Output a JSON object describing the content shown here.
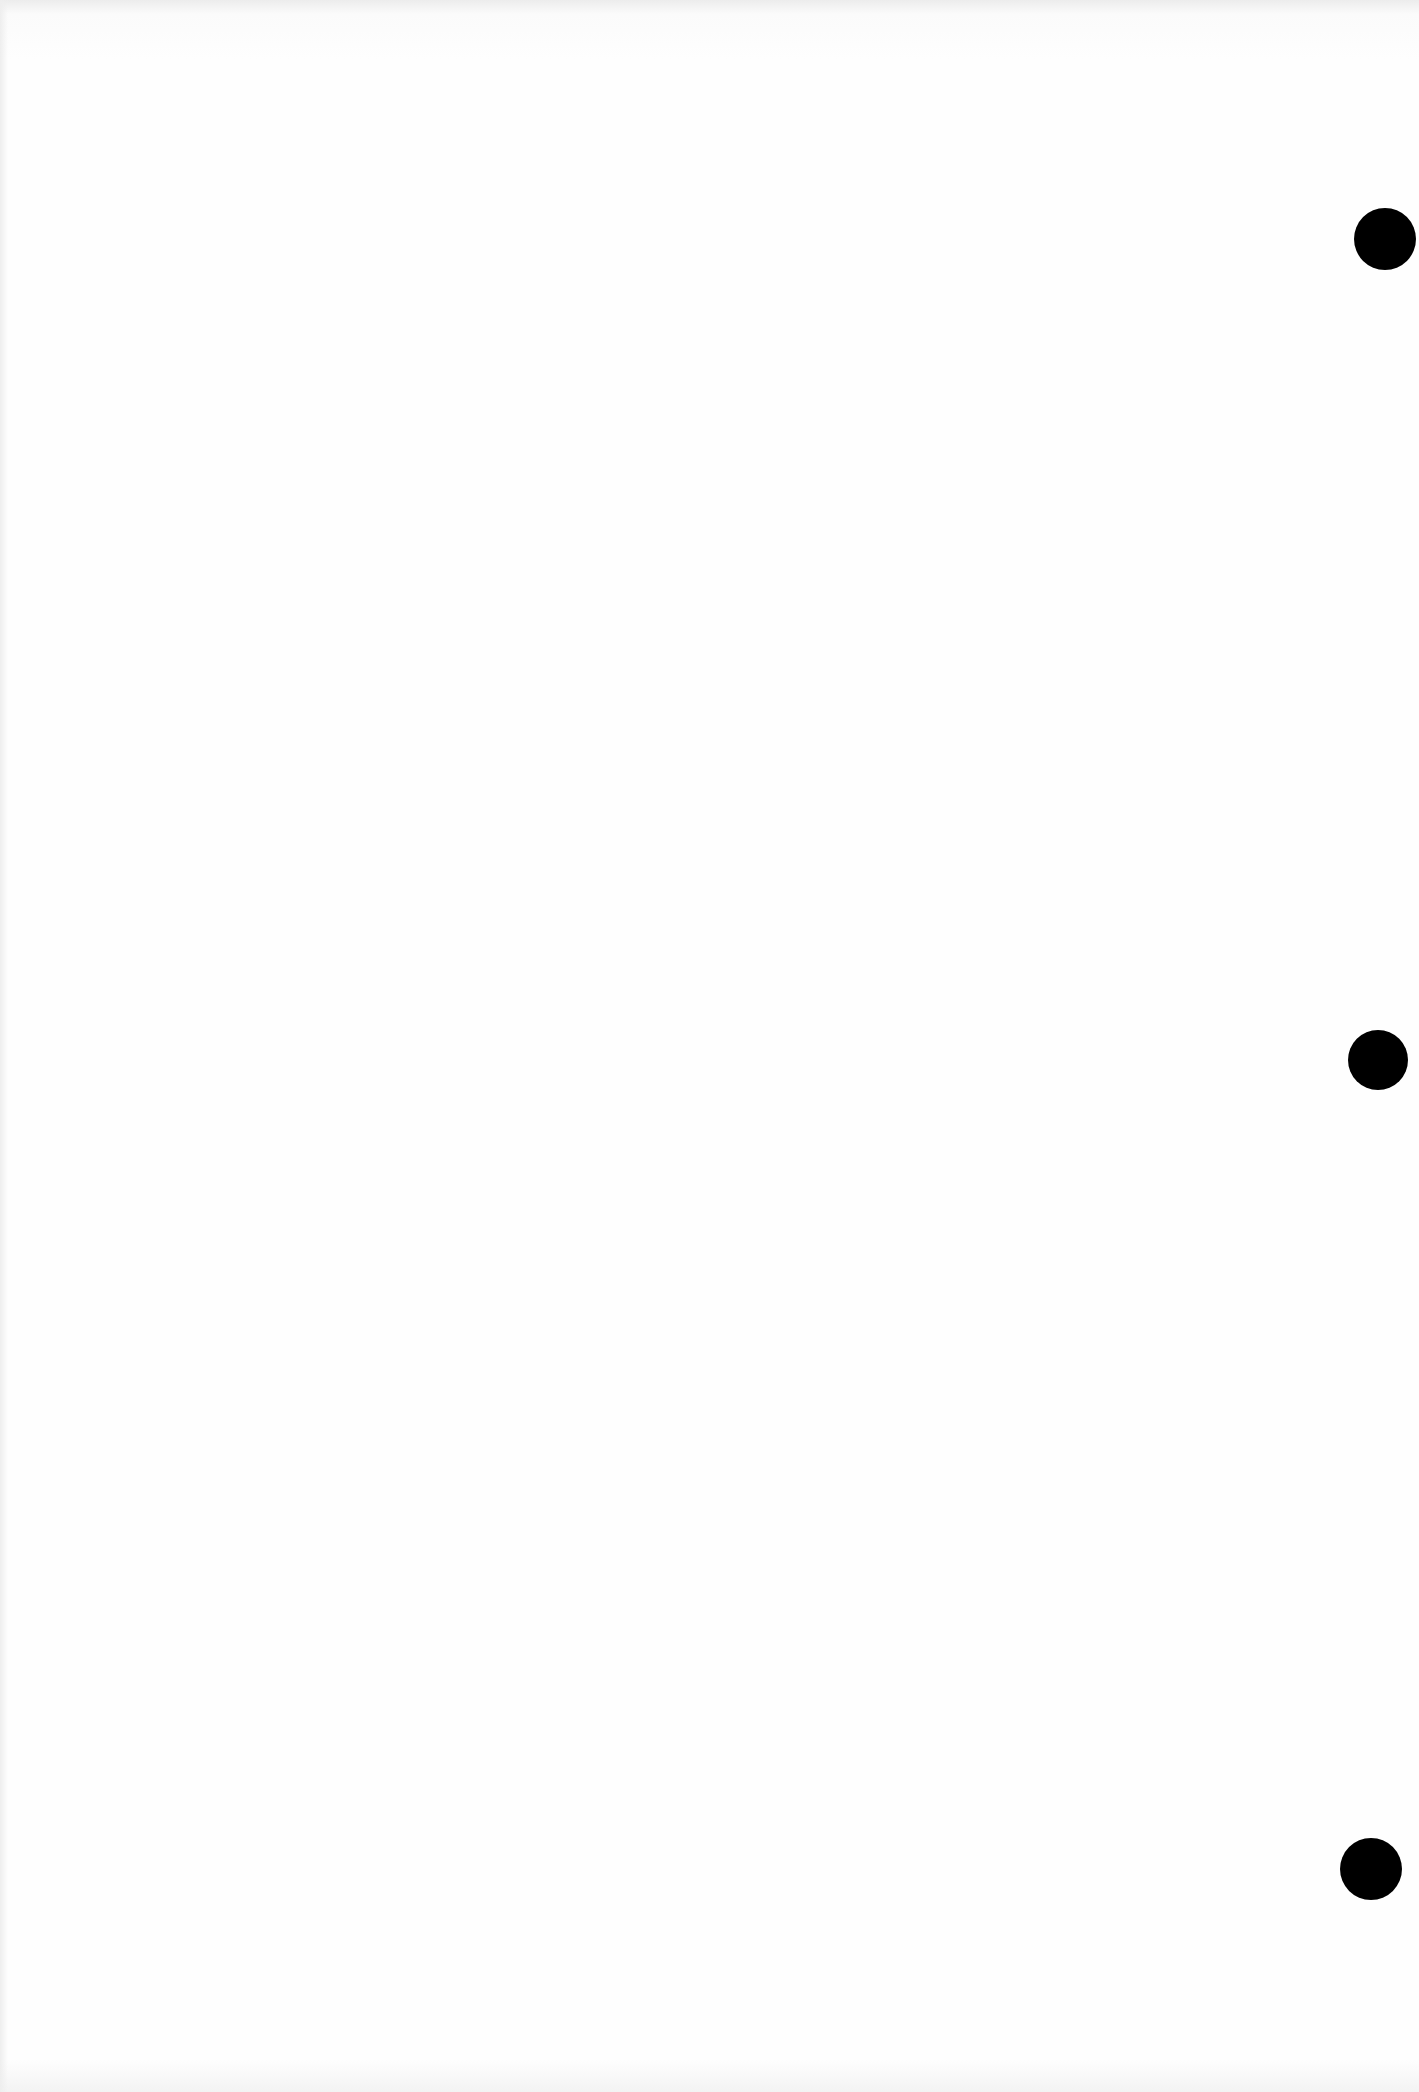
{
  "document": {
    "type": "blank scanned page",
    "text_content": "",
    "punch_holes": [
      {
        "position": "top-right",
        "color": "#000000"
      },
      {
        "position": "middle-right",
        "color": "#000000"
      },
      {
        "position": "bottom-right",
        "color": "#000000"
      }
    ],
    "background_color": "#fdfdfd"
  }
}
